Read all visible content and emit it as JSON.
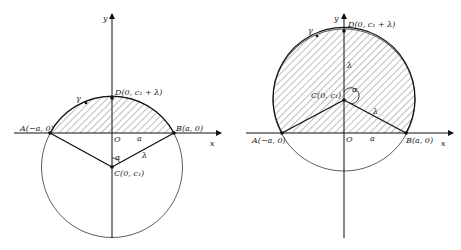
{
  "figures": [
    {
      "id": "left",
      "labels": {
        "y_axis": "y",
        "x_axis": "x",
        "origin": "O",
        "point_a": "A(−a, 0)",
        "point_b": "B(a, 0)",
        "point_c": "C(0, c₁)",
        "point_d": "D(0, c₁ + λ)",
        "curve": "γ",
        "length_a": "a",
        "radius": "λ",
        "angle": "α"
      }
    },
    {
      "id": "right",
      "labels": {
        "y_axis": "y",
        "x_axis": "x",
        "origin": "O",
        "point_a": "A(−a, 0)",
        "point_b": "B(a, 0)",
        "point_c": "C(0, c₁)",
        "point_d": "D(0, c₁ + λ)",
        "curve": "γ",
        "length_a": "a",
        "radius_top": "λ",
        "radius_right": "λ",
        "angle": "α"
      }
    }
  ]
}
